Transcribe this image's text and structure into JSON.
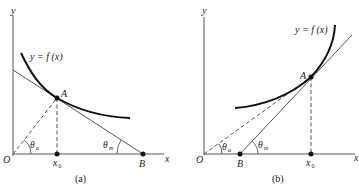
{
  "panels": [
    {
      "id": "a",
      "caption": "(a)",
      "curve_label": "y = f (x)",
      "axis_x": "x",
      "axis_y": "y",
      "origin": "O",
      "point_A": "A",
      "point_B": "B",
      "x0": "x",
      "x0_sub": "0",
      "theta_a": "θ",
      "theta_a_sub": "a",
      "theta_m": "θ",
      "theta_m_sub": "m"
    },
    {
      "id": "b",
      "caption": "(b)",
      "curve_label": "y = f (x)",
      "axis_x": "x",
      "axis_y": "y",
      "origin": "O",
      "point_A": "A",
      "point_B": "B",
      "x0": "x",
      "x0_sub": "0",
      "theta_a": "θ",
      "theta_a_sub": "a",
      "theta_m": "θ",
      "theta_m_sub": "m"
    }
  ],
  "colors": {
    "line": "#333333",
    "curve": "#111111",
    "point": "#111111"
  }
}
